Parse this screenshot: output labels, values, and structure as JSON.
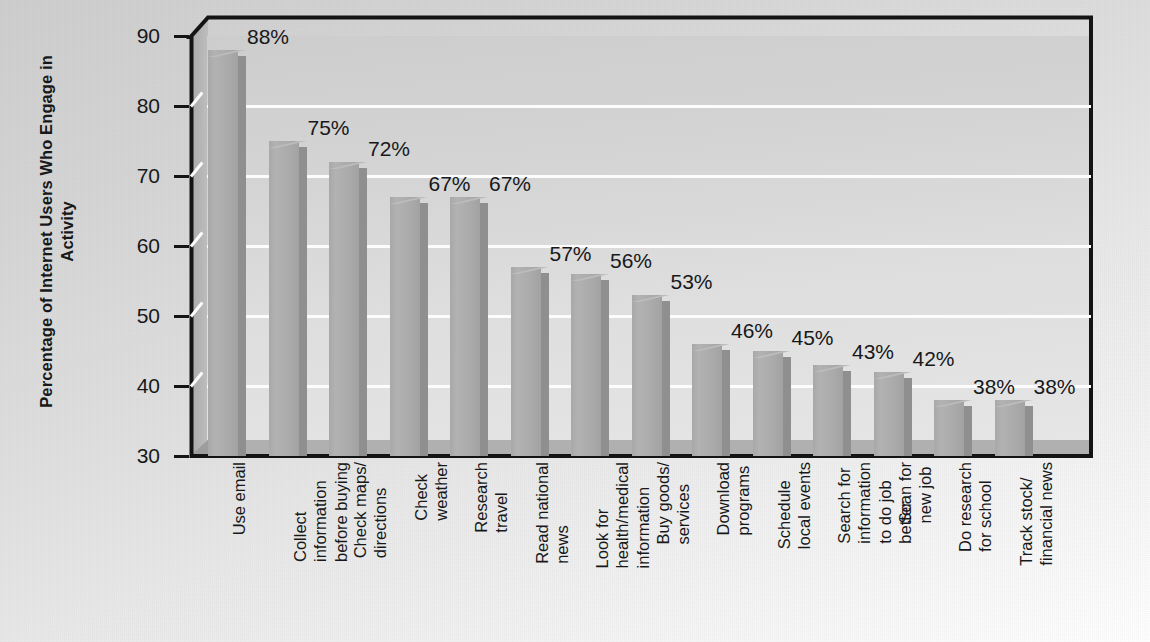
{
  "chart_data": {
    "type": "bar",
    "title": "",
    "xlabel": "",
    "ylabel": "Percentage of Internet Users Who Engage in Activity",
    "ylim": [
      30,
      90
    ],
    "yticks": [
      30,
      40,
      50,
      60,
      70,
      80,
      90
    ],
    "ytick_labels": [
      "30",
      "40",
      "50",
      "60",
      "70",
      "80",
      "90"
    ],
    "gridlines": [
      40,
      50,
      60,
      70,
      80
    ],
    "grid": true,
    "legend": "none",
    "value_suffix": "%",
    "categories": [
      "Use email",
      "Collect\ninformation\nbefore buying",
      "Check maps/\ndirections",
      "Check\nweather",
      "Research\ntravel",
      "Read national\nnews",
      "Look for\nhealth/medical\ninformation",
      "Buy goods/\nservices",
      "Download\nprograms",
      "Schedule\nlocal events",
      "Search for\ninformation\nto do job\nbetter",
      "Scan for\nnew job",
      "Do research\nfor school",
      "Track stock/\nfinancial news"
    ],
    "values": [
      88,
      75,
      72,
      67,
      67,
      57,
      56,
      53,
      46,
      45,
      43,
      42,
      38,
      38
    ],
    "value_labels": [
      "88%",
      "75%",
      "72%",
      "67%",
      "67%",
      "57%",
      "56%",
      "53%",
      "46%",
      "45%",
      "43%",
      "42%",
      "38%",
      "38%"
    ],
    "colors": {
      "bar_face": "#ababab",
      "bar_side": "#8f8f8f",
      "plot_background": "#d8d8d8",
      "gridline": "#fcfcfc",
      "axis": "#141414",
      "text": "#17181a",
      "page_background": "#e3e3e3"
    }
  }
}
